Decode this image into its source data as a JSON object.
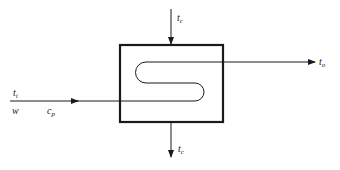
{
  "diagram": {
    "type": "heat-exchanger-schematic",
    "colors": {
      "stroke": "#1a1a1a",
      "background": "#ffffff"
    },
    "labels": {
      "coolant_in": {
        "base": "t",
        "sub": "c"
      },
      "coolant_out": {
        "base": "t",
        "sub": "c"
      },
      "fluid_in_temp": {
        "base": "t",
        "sub": "i"
      },
      "fluid_out_temp": {
        "base": "t",
        "sub": "o"
      },
      "mass_flow": {
        "base": "w"
      },
      "specific_heat": {
        "base": "c",
        "sub": "p"
      }
    }
  }
}
